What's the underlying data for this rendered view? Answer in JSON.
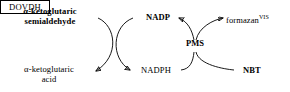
{
  "diagram": {
    "type": "enzymatic-reaction-scheme",
    "background_color": "#ffffff",
    "stroke_color": "#000000",
    "substrate": "α-ketoglutaric\nsemialdehyde",
    "substrate_line1": "α-ketoglutaric",
    "substrate_line2": "semialdehyde",
    "product_line1": "α-ketoglutaric",
    "product_line2": "acid",
    "enzyme": "DOVDH",
    "cofactor_oxidized": "NADP",
    "cofactor_reduced": "NADPH",
    "mediator": "PMS",
    "acceptor": "NBT",
    "dye_product": "formazan",
    "dye_product_superscript": "VIS",
    "arrows": [
      {
        "name": "substrate-to-product",
        "from": "α-ketoglutaric semialdehyde",
        "to": "α-ketoglutaric acid",
        "style": "curved"
      },
      {
        "name": "nadp-to-nadph",
        "from": "NADP",
        "to": "NADPH",
        "style": "curved"
      },
      {
        "name": "nadph-to-pms",
        "from": "NADPH",
        "to": "PMS",
        "style": "curved"
      },
      {
        "name": "pms-to-nadp",
        "from": "PMS",
        "to": "NADP",
        "style": "curved"
      },
      {
        "name": "nbt-to-pms",
        "from": "NBT",
        "to": "PMS",
        "style": "curved"
      },
      {
        "name": "pms-to-formazan",
        "from": "PMS",
        "to": "formazan",
        "style": "curved"
      }
    ]
  }
}
